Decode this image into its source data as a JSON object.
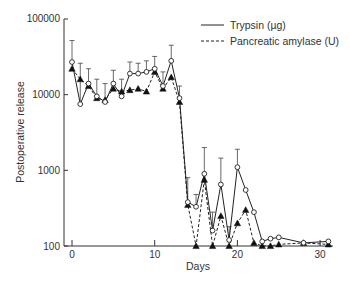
{
  "chart_data": {
    "type": "line",
    "title": "",
    "xlabel": "Days",
    "ylabel": "Postoperative release",
    "yscale": "log",
    "xlim": [
      0,
      31
    ],
    "ylim": [
      100,
      100000
    ],
    "x_ticks": [
      0,
      10,
      20,
      30
    ],
    "x_tick_labels": [
      "0",
      "10",
      "20",
      "30"
    ],
    "y_ticks": [
      100,
      1000,
      10000,
      100000
    ],
    "y_tick_labels": [
      "100",
      "1000",
      "10000",
      "100000"
    ],
    "grid": false,
    "legend_position": "top-right",
    "colors": {
      "ink": "#222222",
      "background": "#ffffff"
    },
    "series": [
      {
        "name": "Trypsin (µg)",
        "line_style": "solid",
        "marker": "open-circle",
        "x": [
          0,
          1,
          2,
          3,
          4,
          5,
          6,
          7,
          8,
          9,
          10,
          11,
          12,
          13,
          14,
          15,
          16,
          17,
          18,
          19,
          20,
          21,
          22,
          23,
          24,
          25,
          28,
          31
        ],
        "values": [
          27000,
          7500,
          14000,
          9500,
          8000,
          14000,
          9500,
          19000,
          19000,
          20000,
          22000,
          13000,
          28000,
          9000,
          380,
          330,
          900,
          160,
          650,
          120,
          1100,
          550,
          280,
          115,
          125,
          130,
          110,
          115
        ],
        "error_upper": [
          52000,
          26000,
          22000,
          16000,
          14000,
          21000,
          16000,
          27000,
          26000,
          28000,
          32000,
          20000,
          45000,
          13000,
          800,
          480,
          2000,
          280,
          1450,
          180,
          1900,
          0,
          0,
          0,
          0,
          0,
          0,
          0
        ]
      },
      {
        "name": "Pancreatic amylase (U)",
        "line_style": "dashed",
        "marker": "filled-triangle",
        "x": [
          0,
          1,
          2,
          3,
          4,
          5,
          6,
          7,
          8,
          9,
          10,
          11,
          12,
          13,
          14,
          15,
          16,
          17,
          18,
          19,
          20,
          21,
          22,
          23,
          24,
          25,
          28,
          31
        ],
        "values": [
          22000,
          16000,
          13000,
          9000,
          8500,
          12000,
          11000,
          11500,
          12000,
          11000,
          20000,
          12000,
          17000,
          8000,
          350,
          100,
          750,
          100,
          250,
          100,
          200,
          300,
          110,
          100,
          100,
          105,
          110,
          105
        ],
        "error_upper": [
          0,
          0,
          0,
          0,
          0,
          0,
          0,
          0,
          0,
          0,
          0,
          0,
          0,
          0,
          0,
          0,
          0,
          0,
          0,
          0,
          0,
          0,
          0,
          0,
          0,
          0,
          0,
          0
        ]
      }
    ]
  },
  "legend": {
    "items": [
      {
        "label": "Trypsin (µg)"
      },
      {
        "label": "Pancreatic amylase (U)"
      }
    ]
  }
}
